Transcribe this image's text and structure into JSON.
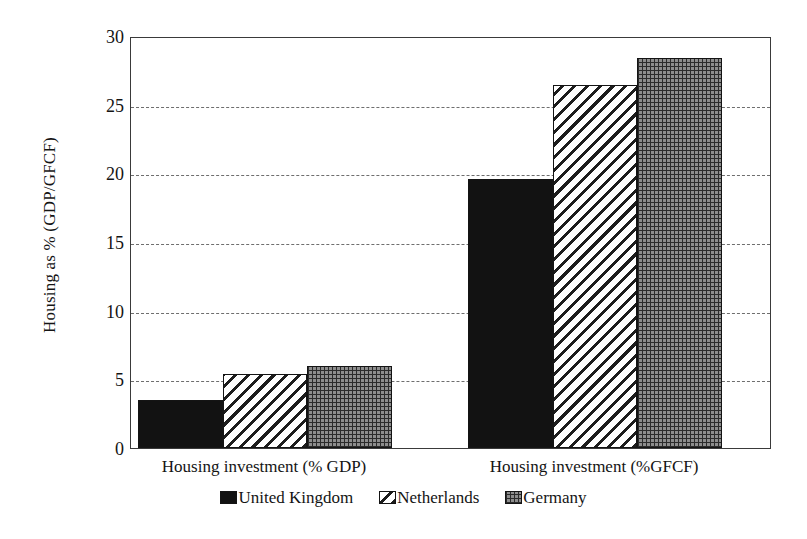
{
  "chart_data": {
    "type": "bar",
    "title": "",
    "subtitle": "",
    "xlabel": "",
    "ylabel": "Housing as % (GDP/GFCF)",
    "categories": [
      "Housing investment (% GDP)",
      "Housing investment (%GFCF)"
    ],
    "series": [
      {
        "name": "United Kingdom",
        "values": [
          3.5,
          19.6
        ],
        "pattern": "solid-black",
        "color": "#121212"
      },
      {
        "name": "Netherlands",
        "values": [
          5.4,
          26.4
        ],
        "pattern": "diagonal-hatch",
        "color": "#ffffff"
      },
      {
        "name": "Germany",
        "values": [
          6.0,
          28.4
        ],
        "pattern": "checkered",
        "color": "#8d8d8d"
      }
    ],
    "ylim": [
      0,
      30
    ],
    "ytick_labels": [
      "0",
      "5",
      "10",
      "15",
      "20",
      "25",
      "30"
    ],
    "ytick_values": [
      0,
      5,
      10,
      15,
      20,
      25,
      30
    ],
    "grid": true,
    "grid_style": "dashed-horizontal",
    "legend_position": "bottom-center",
    "bar_group_gap": true,
    "plot_border": true
  },
  "axis": {
    "y_title": "Housing as % (GDP/GFCF)"
  },
  "legend": {
    "items": [
      {
        "label": "United Kingdom"
      },
      {
        "label": "Netherlands"
      },
      {
        "label": "Germany"
      }
    ]
  }
}
